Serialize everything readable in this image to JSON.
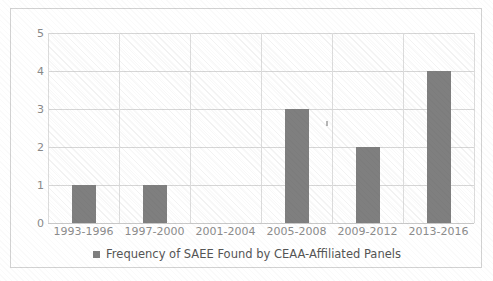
{
  "chart_data": {
    "type": "bar",
    "title": "",
    "subtitle": "",
    "xlabel": "",
    "ylabel": "",
    "categories": [
      "1993-1996",
      "1997-2000",
      "2001-2004",
      "2005-2008",
      "2009-2012",
      "2013-2016"
    ],
    "values": [
      1,
      1,
      0,
      3,
      2,
      4
    ],
    "series": [
      {
        "name": "Frequency of SAEE Found by CEAA-Affiliated Panels",
        "values": [
          1,
          1,
          0,
          3,
          2,
          4
        ],
        "color": "#7f7f7f"
      }
    ],
    "ylim": [
      0,
      5
    ],
    "yticks": [
      0,
      1,
      2,
      3,
      4,
      5
    ],
    "ytick_labels": [
      "0",
      "1",
      "2",
      "3",
      "4",
      "5"
    ],
    "grid": "horizontal-and-vertical",
    "legend": {
      "position": "bottom-center",
      "entries": [
        {
          "label": "Frequency of SAEE Found by CEAA-Affiliated Panels",
          "color": "#7f7f7f",
          "marker": "square"
        }
      ]
    },
    "colors": {
      "bar": "#7f7f7f",
      "gridline": "#d6d6d6",
      "axis_text": "#8a8a8a",
      "legend_text": "#555555",
      "frame_border": "#d2d2d2",
      "plot_background": "#ffffff"
    }
  }
}
